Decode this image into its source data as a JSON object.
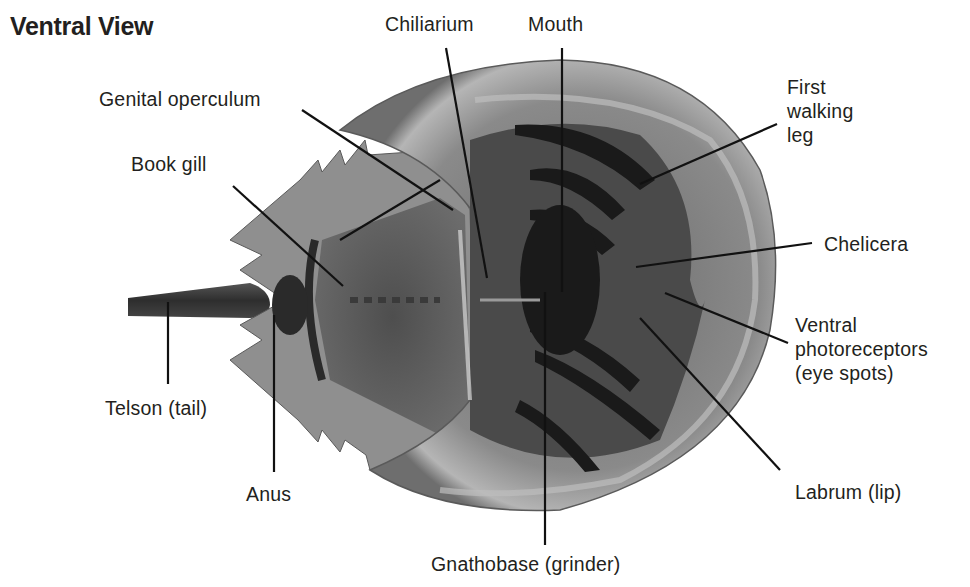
{
  "diagram": {
    "title": "Ventral View",
    "colors": {
      "text": "#231f20",
      "leader": "#111111",
      "background": "#ffffff"
    },
    "labels": {
      "chiliarium": "Chiliarium",
      "mouth": "Mouth",
      "genital_operculum": "Genital operculum",
      "book_gill": "Book gill",
      "first_walking_leg_1": "First",
      "first_walking_leg_2": "walking",
      "first_walking_leg_3": "leg",
      "chelicera": "Chelicera",
      "ventral_photoreceptors_1": "Ventral",
      "ventral_photoreceptors_2": "photoreceptors",
      "ventral_photoreceptors_3": "(eye spots)",
      "telson": "Telson (tail)",
      "anus": "Anus",
      "labrum": "Labrum (lip)",
      "gnathobase": "Gnathobase (grinder)"
    }
  }
}
